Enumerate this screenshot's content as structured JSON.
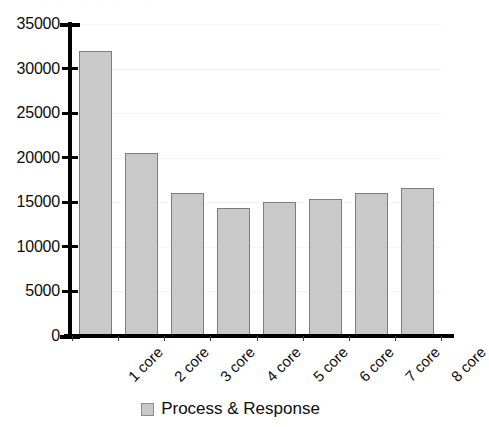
{
  "top_fragment": {
    "text": "·  ·      ·              ·  ·    ·    ·"
  },
  "legend": {
    "position": "bottom-center",
    "swatch_name": "process-response-swatch",
    "label": "Process & Response",
    "color": "#c9c9c9"
  },
  "chart_data": {
    "type": "bar",
    "title": "",
    "xlabel": "",
    "ylabel": "",
    "categories": [
      "1 core",
      "2 core",
      "3 core",
      "4 core",
      "5 core",
      "6 core",
      "7 core",
      "8 core"
    ],
    "series": [
      {
        "name": "Process & Response",
        "color": "#c9c9c9",
        "values": [
          32000,
          20500,
          16000,
          14400,
          15000,
          15400,
          16000,
          16600
        ]
      }
    ],
    "values": [
      32000,
      20500,
      16000,
      14400,
      15000,
      15400,
      16000,
      16600
    ],
    "ylim": [
      0,
      35000
    ],
    "ytick_step": 5000,
    "yticks": [
      0,
      5000,
      10000,
      15000,
      20000,
      25000,
      30000,
      35000
    ],
    "ytick_labels": [
      "0",
      "5000",
      "10000",
      "15000",
      "20000",
      "25000",
      "30000",
      "35000"
    ],
    "grid": true,
    "grid_color": "#f4f4f4",
    "legend_position": "bottom-center",
    "xtick_label_rotation": -45
  }
}
